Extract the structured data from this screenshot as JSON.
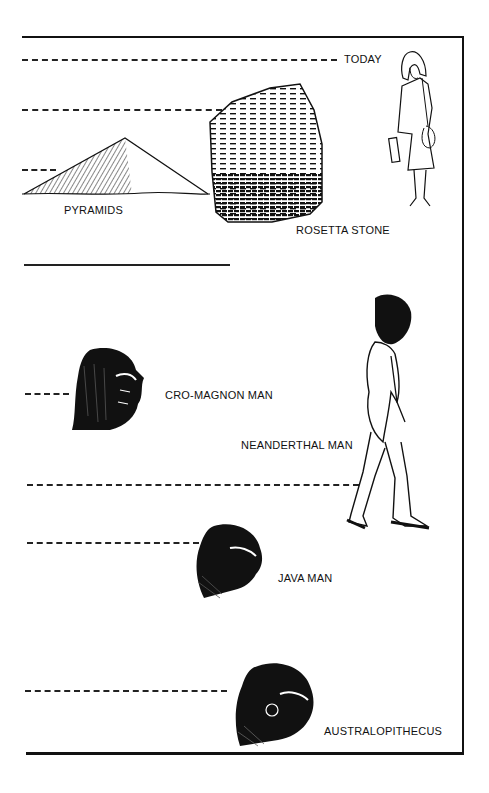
{
  "diagram": {
    "type": "timeline",
    "orientation": "vertical",
    "direction": "top_is_present",
    "events": [
      {
        "label": "TODAY",
        "order": 1
      },
      {
        "label": "ROSETTA STONE",
        "order": 2
      },
      {
        "label": "PYRAMIDS",
        "order": 3
      },
      {
        "label": "CRO-MAGNON MAN",
        "order": 4
      },
      {
        "label": "NEANDERTHAL MAN",
        "order": 5
      },
      {
        "label": "JAVA MAN",
        "order": 6
      },
      {
        "label": "AUSTRALOPITHECUS",
        "order": 7
      }
    ],
    "scale_break": "solid line between PYRAMIDS and CRO-MAGNON MAN",
    "colors": {
      "ink": "#111111",
      "background": "#ffffff"
    }
  },
  "labels": {
    "today": "TODAY",
    "pyramids": "PYRAMIDS",
    "rosetta": "ROSETTA STONE",
    "cromagnon": "CRO-MAGNON MAN",
    "neanderthal": "NEANDERTHAL MAN",
    "java": "JAVA MAN",
    "australopithecus": "AUSTRALOPITHECUS"
  }
}
